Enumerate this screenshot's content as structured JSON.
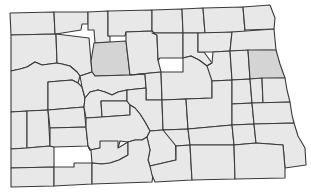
{
  "map": {
    "subject": "North Dakota counties",
    "fill_color": "#e8e8e8",
    "highlight_color": "#d4d4d4",
    "stroke_color": "#3a3a3a",
    "highlighted_counties": [
      "Ward",
      "Grand Forks"
    ]
  }
}
